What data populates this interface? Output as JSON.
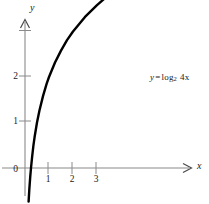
{
  "chart_data": {
    "type": "line",
    "title": "",
    "subtitle": "",
    "xlabel": "x",
    "ylabel": "y",
    "equation": "y = log_2 4x",
    "equation_parts": {
      "lhs": "y",
      "equals": "=",
      "function": "log",
      "base": "2",
      "argument": "4x"
    },
    "xlim": [
      -0.4,
      7.6
    ],
    "ylim": [
      -0.9,
      2.9
    ],
    "x_ticks": [
      1,
      2,
      3
    ],
    "x_tick_labels": [
      "1",
      "2",
      "3"
    ],
    "y_ticks": [
      1,
      2
    ],
    "y_tick_labels": [
      "1",
      "2"
    ],
    "origin_label": "0",
    "grid": false,
    "legend": "none",
    "axis_arrows": [
      "x-positive",
      "y-positive"
    ],
    "series": [
      {
        "name": "y = log_2 4x",
        "color": "#000000",
        "x": [
          0.15,
          0.18,
          0.22,
          0.25,
          0.3,
          0.35,
          0.4,
          0.5,
          0.6,
          0.75,
          0.9,
          1.0,
          1.25,
          1.5,
          1.75,
          2.0,
          2.5,
          3.0,
          3.5,
          4.0,
          4.5,
          5.0,
          5.5,
          6.0,
          6.5,
          7.0,
          7.4
        ],
        "y": [
          -0.74,
          -0.47,
          -0.18,
          0.0,
          0.26,
          0.49,
          0.68,
          1.0,
          1.26,
          1.58,
          1.85,
          2.0,
          2.32,
          2.58,
          2.81,
          3.0,
          3.32,
          3.58,
          3.81,
          4.0,
          4.17,
          4.32,
          4.46,
          4.58,
          4.7,
          4.81,
          4.89
        ]
      }
    ]
  },
  "colors": {
    "curve": "#000000",
    "axis": "#8a8a8a",
    "tick": "#8a8a8a",
    "text": "#1a1a1a",
    "background": "#ffffff"
  }
}
